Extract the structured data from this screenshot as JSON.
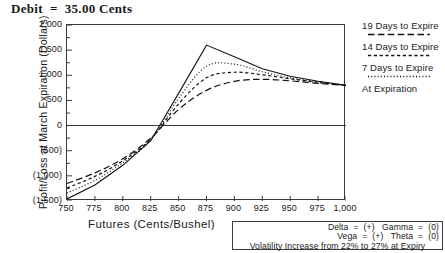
{
  "chart_data": {
    "type": "line",
    "title": "Debit  =  35.00 Cents",
    "xlabel": "Futures (Cents/Bushel)",
    "ylabel": "Profit/Loss at March Expiration (Dollars)",
    "xlim": [
      750,
      1000
    ],
    "ylim": [
      -1500,
      2000
    ],
    "grid": false,
    "legend_position": "right",
    "xticks": [
      "750",
      "775",
      "800",
      "825",
      "850",
      "875",
      "900",
      "925",
      "950",
      "975",
      "1,000"
    ],
    "xtick_values": [
      750,
      775,
      800,
      825,
      850,
      875,
      900,
      925,
      950,
      975,
      1000
    ],
    "yticks": [
      "2,000",
      "1,500",
      "1,000",
      "500",
      "0",
      "(500)",
      "(1,000)",
      "(1,500)"
    ],
    "ytick_values": [
      2000,
      1500,
      1000,
      500,
      0,
      -500,
      -1000,
      -1500
    ],
    "zero_line": 0,
    "x": [
      750,
      775,
      800,
      825,
      850,
      875,
      900,
      925,
      950,
      975,
      1000
    ],
    "series": [
      {
        "name": "At Expiration",
        "style": "solid",
        "values": [
          -1460,
          -1180,
          -790,
          -300,
          640,
          1600,
          1370,
          1130,
          980,
          880,
          800
        ]
      },
      {
        "name": "7 Days to Expire",
        "style": "dotted",
        "values": [
          -1340,
          -1090,
          -740,
          -290,
          540,
          1180,
          1220,
          1070,
          950,
          870,
          800
        ]
      },
      {
        "name": "14 Days to Expire",
        "style": "dashed",
        "values": [
          -1240,
          -1010,
          -700,
          -270,
          430,
          950,
          1060,
          1010,
          930,
          860,
          800
        ]
      },
      {
        "name": "19 Days to Expire",
        "style": "longdash",
        "values": [
          -1150,
          -940,
          -660,
          -250,
          320,
          700,
          880,
          920,
          890,
          840,
          800
        ]
      }
    ]
  },
  "legend": {
    "entries": [
      {
        "label": "19 Days to Expire",
        "style": "longdash"
      },
      {
        "label": "14 Days to Expire",
        "style": "dashed"
      },
      {
        "label": "7 Days to Expire",
        "style": "dotted"
      },
      {
        "label": "At Expiration",
        "style": "solid"
      }
    ]
  },
  "info_box": {
    "line1": "Delta  =  (+)   Gamma  =  (0)",
    "line2": "Vega  =  (+)   Theta  =  (0)",
    "line3": "Volatility Increase from 22% to 27% at Expiry"
  },
  "colors": {
    "axis": "#3a3a3a",
    "line": "#111111",
    "background": "#ffffff"
  }
}
